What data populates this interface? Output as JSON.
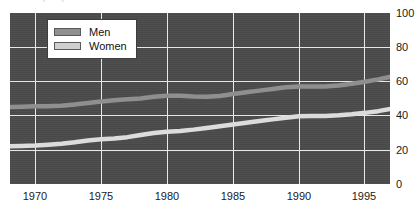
{
  "figure": {
    "caption_fragment": "Labour force participation rates",
    "background_color": "#ffffff"
  },
  "legend": {
    "position": "top-left-inside",
    "entries": [
      {
        "label": "Men",
        "color": "#8f8f8f",
        "icon": "legend-swatch-icon"
      },
      {
        "label": "Women",
        "color": "#cfcfcf",
        "icon": "legend-swatch-icon"
      }
    ]
  },
  "axes": {
    "y_ticks": [
      "100",
      "80",
      "60",
      "40",
      "20",
      "0"
    ],
    "y_tick_side": "right",
    "x_ticks": [
      "1970",
      "1975",
      "1980",
      "1985",
      "1990",
      "1995"
    ],
    "plot_background_color": "#4a4a4a",
    "gridline_color": "#e8e8e8"
  },
  "chart_data": {
    "type": "line",
    "title": "",
    "subtitle": "",
    "xlabel": "",
    "ylabel": "",
    "xlim": [
      1968.1,
      1996.9
    ],
    "ylim": [
      0,
      100
    ],
    "y_ticks": [
      0,
      20,
      40,
      60,
      80,
      100
    ],
    "x_ticks": [
      1970,
      1975,
      1980,
      1985,
      1990,
      1995
    ],
    "grid": true,
    "legend_position": "upper left",
    "x": [
      1968,
      1969,
      1970,
      1971,
      1972,
      1973,
      1974,
      1975,
      1976,
      1977,
      1978,
      1979,
      1980,
      1981,
      1982,
      1983,
      1984,
      1985,
      1986,
      1987,
      1988,
      1989,
      1990,
      1991,
      1992,
      1993,
      1994,
      1995,
      1996,
      1997
    ],
    "series": [
      {
        "name": "Men",
        "color": "#8f8f8f",
        "values": [
          45.0,
          45.2,
          45.5,
          45.5,
          45.8,
          46.5,
          47.4,
          48.3,
          49.0,
          49.5,
          50.0,
          51.0,
          51.6,
          51.6,
          51.2,
          51.0,
          51.5,
          52.6,
          53.6,
          54.6,
          55.6,
          56.6,
          57.0,
          57.0,
          57.0,
          57.6,
          58.6,
          59.8,
          61.2,
          62.8
        ]
      },
      {
        "name": "Women",
        "color": "#dcdcdc",
        "values": [
          22.0,
          22.2,
          22.5,
          23.0,
          23.6,
          24.4,
          25.4,
          26.2,
          26.6,
          27.4,
          28.6,
          29.8,
          30.6,
          31.0,
          31.8,
          32.8,
          33.8,
          34.8,
          35.8,
          36.8,
          37.8,
          38.8,
          39.6,
          39.8,
          39.8,
          40.2,
          40.8,
          41.6,
          42.6,
          44.0
        ]
      }
    ]
  }
}
